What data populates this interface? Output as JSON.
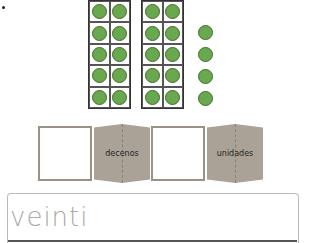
{
  "ten_frames": [
    {
      "rows": 5,
      "cols": 2,
      "filled": 10
    },
    {
      "rows": 5,
      "cols": 2,
      "filled": 10
    }
  ],
  "loose_counters": 4,
  "counter_color": "#6aa84f",
  "place_value": {
    "tens_label": "decenos",
    "ones_label": "unidades",
    "tens_value": "",
    "ones_value": ""
  },
  "answer": {
    "text": "veinti"
  }
}
